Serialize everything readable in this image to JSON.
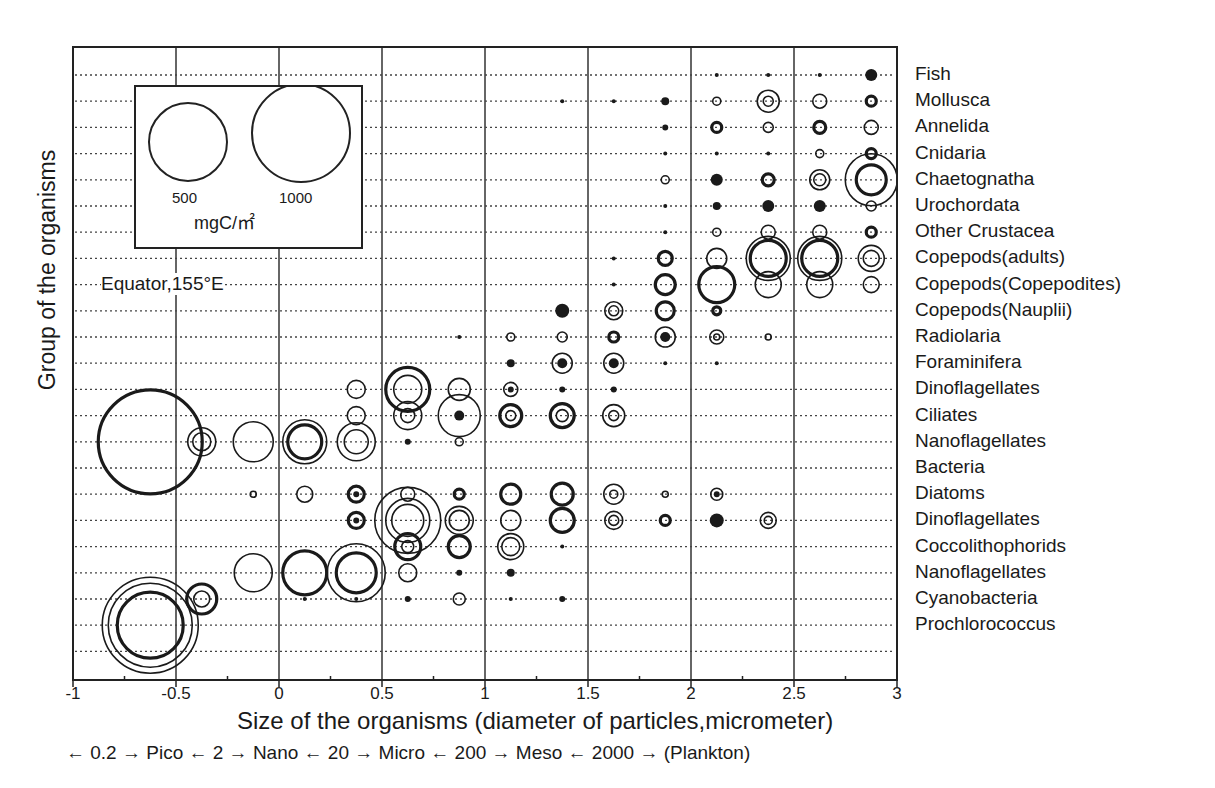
{
  "chart_data": {
    "type": "scatter",
    "subtype": "bubble",
    "title": "",
    "xlabel": "Size of the organisms (diameter of particles,micrometer)",
    "xlabel_secondary": "← 0.2 → Pico ← 2 → Nano ← 20 → Micro ← 200 → Meso ← 2000 → (Plankton)",
    "ylabel": "Group of the organisms",
    "xlim": [
      -1,
      3
    ],
    "x_ticks": [
      "-1",
      "-0.5",
      "0",
      "0.5",
      "1",
      "1.5",
      "2",
      "2.5",
      "3"
    ],
    "grid": {
      "vertical": true,
      "horizontal": "dotted"
    },
    "annotation": "Equator,155°E",
    "legend": {
      "position": "top-left inset",
      "sizes": [
        {
          "label": "500",
          "value": 500
        },
        {
          "label": "1000",
          "value": 1000
        }
      ],
      "unit": "mgC/㎡"
    },
    "categories": [
      "Fish",
      "Mollusca",
      "Annelida",
      "Cnidaria",
      "Chaetognatha",
      "Urochordata",
      "Other Crustacea",
      "Copepods(adults)",
      "Copepods(Copepodites)",
      "Copepods(Nauplii)",
      "Radiolaria",
      "Foraminifera",
      "Dinoflagellates",
      "Ciliates",
      "Nanoflagellates",
      "Bacteria",
      "Diatoms",
      "Dinoflagellates",
      "Coccolithophorids",
      "Nanoflagellates",
      "Cyanobacteria",
      "Prochlorococcus"
    ],
    "bubble_encoding": "[x_log_um, category_index, radius_px, style] style: o=open, t=thick open, f=filled dot",
    "bubbles": [
      [
        2.875,
        0,
        6,
        "f"
      ],
      [
        2.625,
        0,
        2,
        "f"
      ],
      [
        2.375,
        0,
        2,
        "f"
      ],
      [
        2.125,
        0,
        2,
        "f"
      ],
      [
        1.875,
        1,
        4,
        "f"
      ],
      [
        1.625,
        1,
        2,
        "f"
      ],
      [
        1.375,
        1,
        2,
        "f"
      ],
      [
        2.125,
        1,
        4,
        "o"
      ],
      [
        2.375,
        1,
        11,
        "o"
      ],
      [
        2.375,
        1,
        5,
        "o"
      ],
      [
        2.625,
        1,
        7,
        "o"
      ],
      [
        2.875,
        1,
        5,
        "t"
      ],
      [
        1.875,
        2,
        3,
        "f"
      ],
      [
        2.125,
        2,
        5,
        "t"
      ],
      [
        2.375,
        2,
        5,
        "o"
      ],
      [
        2.625,
        2,
        6,
        "t"
      ],
      [
        2.875,
        2,
        7,
        "o"
      ],
      [
        1.875,
        3,
        2,
        "f"
      ],
      [
        2.125,
        3,
        2,
        "f"
      ],
      [
        2.375,
        3,
        2,
        "f"
      ],
      [
        2.625,
        3,
        4,
        "o"
      ],
      [
        2.875,
        3,
        5,
        "t"
      ],
      [
        1.875,
        4,
        4,
        "o"
      ],
      [
        2.125,
        4,
        6,
        "f"
      ],
      [
        2.375,
        4,
        6,
        "t"
      ],
      [
        2.625,
        4,
        10,
        "o"
      ],
      [
        2.625,
        4,
        6,
        "o"
      ],
      [
        2.875,
        4,
        26,
        "o"
      ],
      [
        2.875,
        4,
        15,
        "t"
      ],
      [
        1.875,
        5,
        2,
        "f"
      ],
      [
        2.125,
        5,
        4,
        "f"
      ],
      [
        2.375,
        5,
        6,
        "f"
      ],
      [
        2.625,
        5,
        6,
        "f"
      ],
      [
        2.875,
        5,
        5,
        "o"
      ],
      [
        1.875,
        6,
        2,
        "f"
      ],
      [
        2.125,
        6,
        4,
        "o"
      ],
      [
        2.375,
        6,
        7,
        "o"
      ],
      [
        2.625,
        6,
        7,
        "o"
      ],
      [
        2.875,
        6,
        5,
        "t"
      ],
      [
        1.625,
        7,
        2,
        "f"
      ],
      [
        1.875,
        7,
        7,
        "t"
      ],
      [
        2.125,
        7,
        10,
        "o"
      ],
      [
        2.375,
        7,
        22,
        "o"
      ],
      [
        2.375,
        7,
        18,
        "t"
      ],
      [
        2.625,
        7,
        22,
        "o"
      ],
      [
        2.625,
        7,
        18,
        "t"
      ],
      [
        2.875,
        7,
        13,
        "o"
      ],
      [
        2.875,
        7,
        8,
        "o"
      ],
      [
        1.625,
        8,
        2,
        "f"
      ],
      [
        1.875,
        8,
        10,
        "t"
      ],
      [
        2.125,
        8,
        18,
        "t"
      ],
      [
        2.375,
        8,
        13,
        "o"
      ],
      [
        2.625,
        8,
        13,
        "o"
      ],
      [
        2.875,
        8,
        8,
        "o"
      ],
      [
        1.375,
        9,
        7,
        "f"
      ],
      [
        1.625,
        9,
        9,
        "o"
      ],
      [
        1.625,
        9,
        5,
        "o"
      ],
      [
        1.875,
        9,
        9,
        "t"
      ],
      [
        2.125,
        9,
        4,
        "t"
      ],
      [
        0.875,
        10,
        2,
        "f"
      ],
      [
        1.125,
        10,
        4,
        "o"
      ],
      [
        1.375,
        10,
        5,
        "o"
      ],
      [
        1.625,
        10,
        5,
        "t"
      ],
      [
        1.875,
        10,
        10,
        "o"
      ],
      [
        1.875,
        10,
        5,
        "f"
      ],
      [
        2.125,
        10,
        7,
        "o"
      ],
      [
        2.125,
        10,
        3,
        "o"
      ],
      [
        2.375,
        10,
        3,
        "o"
      ],
      [
        1.125,
        11,
        4,
        "f"
      ],
      [
        1.375,
        11,
        10,
        "o"
      ],
      [
        1.375,
        11,
        5,
        "f"
      ],
      [
        1.625,
        11,
        10,
        "o"
      ],
      [
        1.625,
        11,
        5,
        "f"
      ],
      [
        1.875,
        11,
        2,
        "f"
      ],
      [
        2.125,
        11,
        2,
        "f"
      ],
      [
        0.375,
        12,
        9,
        "o"
      ],
      [
        0.625,
        12,
        22,
        "t"
      ],
      [
        0.625,
        12,
        14,
        "o"
      ],
      [
        0.875,
        12,
        11,
        "o"
      ],
      [
        1.125,
        12,
        7,
        "o"
      ],
      [
        1.125,
        12,
        3,
        "f"
      ],
      [
        1.375,
        12,
        3,
        "f"
      ],
      [
        1.625,
        12,
        3,
        "f"
      ],
      [
        0.375,
        13,
        9,
        "o"
      ],
      [
        0.625,
        13,
        14,
        "o"
      ],
      [
        0.625,
        13,
        7,
        "o"
      ],
      [
        0.875,
        13,
        21,
        "o"
      ],
      [
        0.875,
        13,
        5,
        "f"
      ],
      [
        1.125,
        13,
        11,
        "t"
      ],
      [
        1.125,
        13,
        5,
        "o"
      ],
      [
        1.375,
        13,
        12,
        "t"
      ],
      [
        1.375,
        13,
        6,
        "o"
      ],
      [
        1.625,
        13,
        11,
        "o"
      ],
      [
        1.625,
        13,
        5,
        "o"
      ],
      [
        -0.625,
        14,
        52,
        "t"
      ],
      [
        -0.375,
        14,
        14,
        "o"
      ],
      [
        -0.375,
        14,
        9,
        "o"
      ],
      [
        -0.125,
        14,
        20,
        "o"
      ],
      [
        0.125,
        14,
        22,
        "o"
      ],
      [
        0.125,
        14,
        17,
        "t"
      ],
      [
        0.375,
        14,
        19,
        "o"
      ],
      [
        0.375,
        14,
        12,
        "o"
      ],
      [
        0.625,
        14,
        3,
        "f"
      ],
      [
        0.875,
        14,
        4,
        "o"
      ],
      [
        -0.125,
        16,
        3,
        "o"
      ],
      [
        0.125,
        16,
        8,
        "o"
      ],
      [
        0.375,
        16,
        8,
        "t"
      ],
      [
        0.375,
        16,
        3,
        "f"
      ],
      [
        0.625,
        16,
        7,
        "o"
      ],
      [
        0.875,
        16,
        5,
        "t"
      ],
      [
        1.125,
        16,
        10,
        "t"
      ],
      [
        1.375,
        16,
        11,
        "t"
      ],
      [
        1.625,
        16,
        10,
        "o"
      ],
      [
        1.625,
        16,
        4,
        "o"
      ],
      [
        1.875,
        16,
        3,
        "o"
      ],
      [
        2.125,
        16,
        6,
        "o"
      ],
      [
        2.125,
        16,
        3,
        "f"
      ],
      [
        0.375,
        17,
        8,
        "t"
      ],
      [
        0.375,
        17,
        3,
        "f"
      ],
      [
        0.625,
        17,
        33,
        "o"
      ],
      [
        0.625,
        17,
        22,
        "o"
      ],
      [
        0.625,
        17,
        16,
        "o"
      ],
      [
        0.875,
        17,
        14,
        "o"
      ],
      [
        0.875,
        17,
        10,
        "o"
      ],
      [
        1.125,
        17,
        10,
        "o"
      ],
      [
        1.375,
        17,
        12,
        "t"
      ],
      [
        1.625,
        17,
        9,
        "o"
      ],
      [
        1.625,
        17,
        5,
        "o"
      ],
      [
        1.875,
        17,
        5,
        "t"
      ],
      [
        2.125,
        17,
        7,
        "f"
      ],
      [
        2.375,
        17,
        8,
        "o"
      ],
      [
        2.375,
        17,
        4,
        "o"
      ],
      [
        0.625,
        18,
        13,
        "t"
      ],
      [
        0.625,
        18,
        6,
        "o"
      ],
      [
        0.875,
        18,
        11,
        "t"
      ],
      [
        1.125,
        18,
        13,
        "o"
      ],
      [
        1.125,
        18,
        9,
        "o"
      ],
      [
        1.375,
        18,
        2,
        "f"
      ],
      [
        -0.125,
        19,
        19,
        "o"
      ],
      [
        0.125,
        19,
        22,
        "t"
      ],
      [
        0.375,
        19,
        29,
        "o"
      ],
      [
        0.375,
        19,
        20,
        "t"
      ],
      [
        0.625,
        19,
        9,
        "o"
      ],
      [
        0.875,
        19,
        3,
        "f"
      ],
      [
        1.125,
        19,
        4,
        "f"
      ],
      [
        -0.375,
        20,
        15,
        "t"
      ],
      [
        -0.375,
        20,
        8,
        "o"
      ],
      [
        0.125,
        20,
        2,
        "f"
      ],
      [
        0.375,
        20,
        2,
        "f"
      ],
      [
        0.625,
        20,
        3,
        "f"
      ],
      [
        0.875,
        20,
        6,
        "o"
      ],
      [
        1.125,
        20,
        2,
        "f"
      ],
      [
        1.375,
        20,
        3,
        "f"
      ],
      [
        -0.625,
        21,
        48,
        "o"
      ],
      [
        -0.625,
        21,
        42,
        "o"
      ],
      [
        -0.625,
        21,
        33,
        "t"
      ]
    ]
  },
  "plot": {
    "station": "Equator,155°E",
    "legend_small": "500",
    "legend_large": "1000",
    "legend_unit": "mgC/㎡"
  }
}
